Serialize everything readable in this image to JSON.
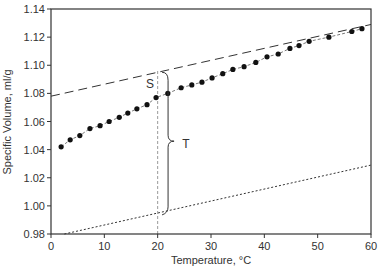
{
  "chart_data": {
    "type": "scatter",
    "title": "",
    "xlabel": "Temperature, °C",
    "ylabel": "Specific Volume, ml/g",
    "xlim": [
      0,
      60
    ],
    "ylim": [
      0.98,
      1.14
    ],
    "xticks": [
      "0",
      "10",
      "20",
      "30",
      "40",
      "50",
      "60"
    ],
    "yticks": [
      "0.98",
      "1.00",
      "1.02",
      "1.04",
      "1.06",
      "1.08",
      "1.10",
      "1.12",
      "1.14"
    ],
    "grid": false,
    "legend": null,
    "series": [
      {
        "name": "measured specific volume",
        "style": "filled circles joined by thin dashed line",
        "x": [
          1.9,
          3.6,
          5.4,
          7.3,
          9.2,
          10.9,
          12.8,
          14.4,
          16.1,
          18.0,
          19.7,
          21.9,
          24.4,
          26.4,
          28.3,
          30.2,
          32.2,
          34.1,
          36.2,
          38.4,
          40.5,
          42.6,
          44.8,
          46.5,
          48.4,
          52.1,
          56.4,
          58.3
        ],
        "y": [
          1.042,
          1.047,
          1.05,
          1.055,
          1.057,
          1.06,
          1.063,
          1.066,
          1.069,
          1.072,
          1.077,
          1.08,
          1.084,
          1.086,
          1.088,
          1.091,
          1.094,
          1.097,
          1.099,
          1.102,
          1.106,
          1.108,
          1.112,
          1.114,
          1.117,
          1.12,
          1.124,
          1.126
        ]
      },
      {
        "name": "upper extrapolated line",
        "style": "long dashed line",
        "x": [
          0,
          60
        ],
        "y": [
          1.078,
          1.129
        ]
      },
      {
        "name": "lower reference line",
        "style": "dotted line",
        "x": [
          2.5,
          60
        ],
        "y": [
          0.98,
          1.029
        ]
      },
      {
        "name": "reference at 20 °C",
        "style": "vertical light dashed line",
        "x": [
          20,
          20
        ],
        "y": [
          0.98,
          1.097
        ]
      }
    ],
    "annotations": [
      {
        "text": "S",
        "x": 17.5,
        "y": 1.087,
        "meaning": "gap between dashed line and data at 20 °C"
      },
      {
        "text": "T",
        "x": 24.5,
        "y": 1.045,
        "meaning": "brace spanning from dotted line to dashed line at ~21 °C"
      }
    ]
  }
}
